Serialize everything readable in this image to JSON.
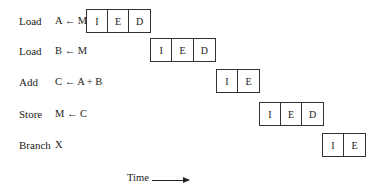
{
  "rows": [
    {
      "op": "Load",
      "instr": "A ← M",
      "stages": [
        "I",
        "E",
        "D"
      ],
      "x": 86,
      "y": 9
    },
    {
      "op": "Load",
      "instr": "B ← M",
      "stages": [
        "I",
        "E",
        "D"
      ],
      "x": 150,
      "y": 38
    },
    {
      "op": "Add",
      "instr": "C ← A + B",
      "stages": [
        "I",
        "E"
      ],
      "x": 216,
      "y": 69
    },
    {
      "op": "Store",
      "instr": "M ← C",
      "stages": [
        "I",
        "E",
        "D"
      ],
      "x": 259,
      "y": 102
    },
    {
      "op": "Branch",
      "instr": "X",
      "stages": [
        "I",
        "E"
      ],
      "x": 322,
      "y": 133
    }
  ],
  "time_axis": {
    "label": "Time",
    "arrow_icon": "right-arrow"
  }
}
